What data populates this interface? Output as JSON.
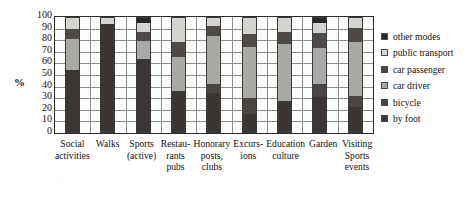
{
  "chart_data": {
    "type": "bar",
    "subtype": "stacked-100",
    "title": "",
    "xlabel": "",
    "ylabel": "%",
    "ylim": [
      0,
      100
    ],
    "ytick_step": 10,
    "yticks": [
      100,
      90,
      80,
      70,
      60,
      50,
      40,
      30,
      20,
      10,
      0
    ],
    "grid": true,
    "legend_position": "right",
    "categories": [
      "Social activities",
      "Walks",
      "Sports (active)",
      "Restaurants pubs",
      "Honorary posts, clubs",
      "Excursions",
      "Education culture",
      "Garden",
      "Visiting Sports events"
    ],
    "category_lines": [
      [
        "Social",
        "activities"
      ],
      [
        "Walks"
      ],
      [
        "Sports",
        "(active)"
      ],
      [
        "Restau-",
        "rants",
        "pubs"
      ],
      [
        "Honorary",
        "posts,",
        "clubs"
      ],
      [
        "Excurs-",
        "ions"
      ],
      [
        "Education",
        "culture"
      ],
      [
        "Garden"
      ],
      [
        "Visiting",
        "Sports",
        "events"
      ]
    ],
    "series": [
      {
        "name": "by foot",
        "color": "#3b3634",
        "values": [
          54,
          95,
          64,
          36,
          34,
          16,
          27,
          31,
          22
        ]
      },
      {
        "name": "bicycle",
        "color": "#4a4542",
        "values": [
          0,
          0,
          0,
          0,
          8,
          14,
          0,
          11,
          10
        ]
      },
      {
        "name": "car driver",
        "color": "#a9a9a6",
        "values": [
          28,
          0,
          16,
          30,
          42,
          45,
          50,
          32,
          47
        ]
      },
      {
        "name": "car passenger",
        "color": "#4f4a47",
        "values": [
          8,
          0,
          8,
          13,
          9,
          11,
          11,
          13,
          12
        ]
      },
      {
        "name": "public transport",
        "color": "#d3d3d0",
        "values": [
          10,
          5,
          8,
          21,
          7,
          14,
          12,
          9,
          9
        ]
      },
      {
        "name": "other modes",
        "color": "#2a2623",
        "values": [
          0,
          0,
          4,
          0,
          0,
          0,
          0,
          4,
          0
        ]
      }
    ]
  },
  "legend": {
    "items": [
      {
        "label": "other modes",
        "color": "#2a2623"
      },
      {
        "label": "public transport",
        "color": "#d3d3d0"
      },
      {
        "label": "car passenger",
        "color": "#4f4a47"
      },
      {
        "label": "car driver",
        "color": "#a9a9a6"
      },
      {
        "label": "bicycle",
        "color": "#4a4542"
      },
      {
        "label": "by foot",
        "color": "#3b3634"
      }
    ]
  }
}
